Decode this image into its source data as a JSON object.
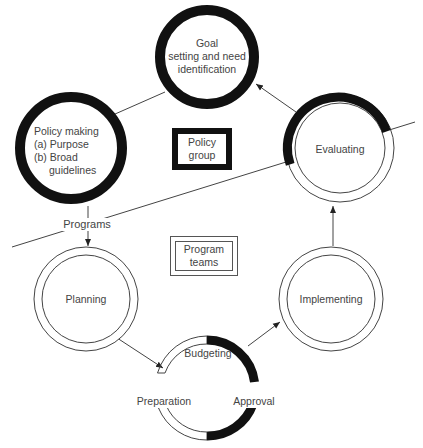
{
  "diagram": {
    "nodes": {
      "goal": {
        "label_lines": [
          "Goal",
          "setting and need",
          "identification"
        ],
        "style": "thick-black-ring"
      },
      "policy_making": {
        "label_lines": [
          "Policy making",
          "(a) Purpose",
          "(b) Broad",
          "guidelines"
        ],
        "style": "thick-black-ring"
      },
      "evaluating": {
        "label": "Evaluating",
        "style": "half-black-half-double-ring"
      },
      "planning": {
        "label": "Planning",
        "style": "double-ring"
      },
      "implementing": {
        "label": "Implementing",
        "style": "double-ring"
      },
      "budgeting": {
        "label": "Budgeting",
        "sub_left": "Preparation",
        "sub_right": "Approval",
        "style": "left-double-right-black"
      }
    },
    "boxes": {
      "policy_group": {
        "label_lines": [
          "Policy",
          "group"
        ]
      },
      "program_teams": {
        "label_lines": [
          "Program",
          "teams"
        ]
      }
    },
    "edge_labels": {
      "programs": "Programs"
    },
    "edges": [
      [
        "goal",
        "policy_making"
      ],
      [
        "policy_making",
        "planning"
      ],
      [
        "planning",
        "budgeting"
      ],
      [
        "budgeting",
        "implementing"
      ],
      [
        "implementing",
        "evaluating"
      ],
      [
        "evaluating",
        "goal"
      ]
    ],
    "colors": {
      "ring": "#111111",
      "line": "#444444",
      "text": "#444444"
    }
  }
}
